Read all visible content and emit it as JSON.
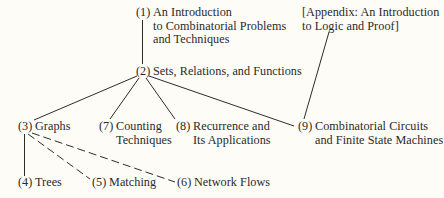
{
  "diagram": {
    "background_color": "#fdfcf6",
    "text_color": "#2a2a2a",
    "line_color": "#2c2c2c",
    "nodes": [
      {
        "id": "n1",
        "number": "(1)",
        "lines": [
          "An Introduction",
          "to Combinatorial Problems",
          "and Techniques"
        ]
      },
      {
        "id": "n2",
        "number": "(2)",
        "lines": [
          "Sets, Relations, and Functions"
        ]
      },
      {
        "id": "n3",
        "number": "(3)",
        "lines": [
          "Graphs"
        ]
      },
      {
        "id": "n4",
        "number": "(4)",
        "lines": [
          "Trees"
        ]
      },
      {
        "id": "n5",
        "number": "(5)",
        "lines": [
          "Matching"
        ]
      },
      {
        "id": "n6",
        "number": "(6)",
        "lines": [
          "Network Flows"
        ]
      },
      {
        "id": "n7",
        "number": "(7)",
        "lines": [
          "Counting",
          "Techniques"
        ]
      },
      {
        "id": "n8",
        "number": "(8)",
        "lines": [
          "Recurrence and",
          "Its Applications"
        ]
      },
      {
        "id": "n9",
        "number": "(9)",
        "lines": [
          "Combinatorial Circuits",
          "and Finite State Machines"
        ]
      },
      {
        "id": "appendix",
        "number": "",
        "lines": [
          "[Appendix: An Introduction",
          "to Logic and Proof]"
        ]
      }
    ],
    "edges": [
      {
        "from": "n1",
        "to": "n2",
        "style": "solid"
      },
      {
        "from": "n2",
        "to": "n3",
        "style": "solid"
      },
      {
        "from": "n2",
        "to": "n7",
        "style": "solid"
      },
      {
        "from": "n2",
        "to": "n8",
        "style": "solid"
      },
      {
        "from": "n2",
        "to": "n9",
        "style": "solid"
      },
      {
        "from": "appendix",
        "to": "n9",
        "style": "solid"
      },
      {
        "from": "n3",
        "to": "n4",
        "style": "solid"
      },
      {
        "from": "n3",
        "to": "n5",
        "style": "dashed"
      },
      {
        "from": "n3",
        "to": "n6",
        "style": "dashed"
      }
    ]
  }
}
